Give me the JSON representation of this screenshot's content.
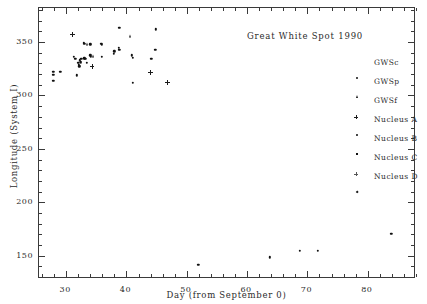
{
  "chart_data": {
    "type": "scatter",
    "title": "Great White Spot 1990",
    "xlabel": "Day (from September 0)",
    "ylabel": "Longitude (System I)",
    "xlim": [
      25.5,
      88
    ],
    "ylim": [
      128,
      382
    ],
    "xticks": [
      30,
      40,
      50,
      60,
      70,
      80
    ],
    "yticks": [
      150,
      200,
      250,
      300,
      350
    ],
    "xtick_labels": [
      "30",
      "40",
      "50",
      "60",
      "70",
      "80"
    ],
    "ytick_labels": [
      "150",
      "200",
      "250",
      "300",
      "350"
    ],
    "xtick_minor_step": 2,
    "ytick_minor_step": 10,
    "grid": false,
    "legend_position": "right",
    "series": [
      {
        "name": "GWSc",
        "marker": "dot",
        "points": [
          [
            27.9,
            322.0
          ],
          [
            27.9,
            319.5
          ],
          [
            27.9,
            314.0
          ],
          [
            29.0,
            322.0
          ],
          [
            31.3,
            336.5
          ],
          [
            31.5,
            334.5
          ],
          [
            31.8,
            319.0
          ],
          [
            32.0,
            330.5
          ],
          [
            32.1,
            329.0
          ],
          [
            32.2,
            327.5
          ],
          [
            32.3,
            333.0
          ],
          [
            32.4,
            331.0
          ],
          [
            32.5,
            334.5
          ],
          [
            32.9,
            349.5
          ],
          [
            33.0,
            348.5
          ],
          [
            33.0,
            335.0
          ],
          [
            33.2,
            334.5
          ],
          [
            33.4,
            330.5
          ],
          [
            34.0,
            337.5
          ],
          [
            34.1,
            336.0
          ],
          [
            34.0,
            348.0
          ],
          [
            35.8,
            348.5
          ],
          [
            35.9,
            347.5
          ],
          [
            35.9,
            336.5
          ],
          [
            37.9,
            339.0
          ],
          [
            38.0,
            341.5
          ],
          [
            38.7,
            344.5
          ],
          [
            38.8,
            343.0
          ],
          [
            38.8,
            363.5
          ],
          [
            40.9,
            337.5
          ],
          [
            41.0,
            335.5
          ],
          [
            41.0,
            312.0
          ],
          [
            44.1,
            334.5
          ],
          [
            44.8,
            343.0
          ],
          [
            44.9,
            362.0
          ],
          [
            51.9,
            141.5
          ],
          [
            63.8,
            148.5
          ],
          [
            68.7,
            154.5
          ],
          [
            71.7,
            154.5
          ],
          [
            83.9,
            170.5
          ]
        ]
      },
      {
        "name": "GWSp",
        "marker": "triangle",
        "points": [
          [
            33.4,
            348.5
          ],
          [
            34.4,
            337.0
          ],
          [
            40.6,
            356.0
          ]
        ]
      },
      {
        "name": "GWSf",
        "marker": "star",
        "points": [
          [
            31.0,
            357.0
          ],
          [
            34.3,
            327.0
          ],
          [
            44.0,
            321.5
          ],
          [
            46.8,
            312.0
          ]
        ]
      },
      {
        "name": "Nucleus A",
        "marker": "dot-small",
        "points": []
      },
      {
        "name": "Nucleus B",
        "marker": "square",
        "points": []
      },
      {
        "name": "Nucleus C",
        "marker": "plus",
        "points": []
      },
      {
        "name": "Nucleus D",
        "marker": "diamond",
        "points": []
      }
    ]
  },
  "legend": {
    "items": [
      {
        "label": "GWSc",
        "marker": "dot"
      },
      {
        "label": "GWSp",
        "marker": "triangle"
      },
      {
        "label": "GWSf",
        "marker": "star"
      },
      {
        "label": "Nucleus A",
        "marker": "dot-small"
      },
      {
        "label": "Nucleus B",
        "marker": "square"
      },
      {
        "label": "Nucleus C",
        "marker": "plus"
      },
      {
        "label": "Nucleus D",
        "marker": "diamond"
      }
    ]
  },
  "colors": {
    "background": "#ffffff",
    "axis": "#3a3a3a",
    "text": "#2b2b2b",
    "marker": "#111111"
  }
}
